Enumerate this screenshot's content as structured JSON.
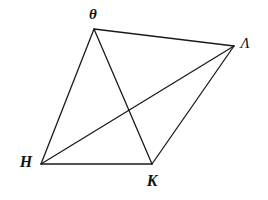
{
  "figure": {
    "background_color": "#ffffff",
    "stroke_color": "#1a1a1a",
    "stroke_width": 1.3,
    "width": 268,
    "height": 200
  },
  "vertices": [
    {
      "id": "theta",
      "label": "θ",
      "x": 94,
      "y": 29,
      "label_x": 93,
      "label_y": 14
    },
    {
      "id": "lambda",
      "label": "Λ",
      "x": 234,
      "y": 46,
      "label_x": 245,
      "label_y": 43
    },
    {
      "id": "kappa",
      "label": "K",
      "x": 152,
      "y": 164,
      "label_x": 152,
      "label_y": 181
    },
    {
      "id": "eta",
      "label": "H",
      "x": 41,
      "y": 164,
      "label_x": 26,
      "label_y": 162
    }
  ],
  "edges": [
    {
      "id": "theta-lambda",
      "from": "theta",
      "to": "lambda",
      "x1": 94,
      "y1": 29,
      "x2": 234,
      "y2": 46,
      "kind": "side"
    },
    {
      "id": "theta-eta",
      "from": "theta",
      "to": "eta",
      "x1": 94,
      "y1": 29,
      "x2": 41,
      "y2": 164,
      "kind": "side"
    },
    {
      "id": "eta-kappa",
      "from": "eta",
      "to": "kappa",
      "x1": 41,
      "y1": 164,
      "x2": 152,
      "y2": 164,
      "kind": "side"
    },
    {
      "id": "kappa-lambda",
      "from": "kappa",
      "to": "lambda",
      "x1": 152,
      "y1": 164,
      "x2": 234,
      "y2": 46,
      "kind": "side"
    },
    {
      "id": "theta-kappa",
      "from": "theta",
      "to": "kappa",
      "x1": 94,
      "y1": 29,
      "x2": 152,
      "y2": 164,
      "kind": "diagonal"
    },
    {
      "id": "eta-lambda",
      "from": "eta",
      "to": "lambda",
      "x1": 41,
      "y1": 164,
      "x2": 234,
      "y2": 46,
      "kind": "diagonal"
    }
  ],
  "intersections": [
    {
      "id": "diagonal-crossing",
      "x": 125,
      "y": 110,
      "edges": [
        "theta-kappa",
        "eta-lambda"
      ]
    }
  ]
}
